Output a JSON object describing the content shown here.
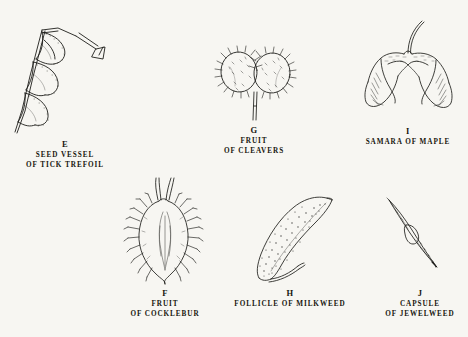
{
  "plate": {
    "title": "Plate of dispersal fruits and seed vessels",
    "background_color": "#f7f6f2",
    "ink_color": "#1a1a18"
  },
  "specimens": [
    {
      "id": "e",
      "letter": "E",
      "caption_lines": [
        "SEED VESSEL",
        "OF TICK TREFOIL"
      ],
      "common_name": "Tick Trefoil",
      "structure": "Seed vessel",
      "art_name": "tick-trefoil-loment-illustration"
    },
    {
      "id": "g",
      "letter": "G",
      "caption_lines": [
        "FRUIT",
        "OF CLEAVERS"
      ],
      "common_name": "Cleavers",
      "structure": "Fruit",
      "art_name": "cleavers-fruit-illustration"
    },
    {
      "id": "i",
      "letter": "I",
      "caption_lines": [
        "SAMARA OF MAPLE"
      ],
      "common_name": "Maple",
      "structure": "Samara",
      "art_name": "maple-samara-illustration"
    },
    {
      "id": "f",
      "letter": "F",
      "caption_lines": [
        "FRUIT",
        "OF COCKLEBUR"
      ],
      "common_name": "Cocklebur",
      "structure": "Fruit",
      "art_name": "cocklebur-fruit-illustration"
    },
    {
      "id": "h",
      "letter": "H",
      "caption_lines": [
        "FOLLICLE OF MILKWEED"
      ],
      "common_name": "Milkweed",
      "structure": "Follicle",
      "art_name": "milkweed-follicle-illustration"
    },
    {
      "id": "j",
      "letter": "J",
      "caption_lines": [
        "CAPSULE",
        "OF JEWELWEED"
      ],
      "common_name": "Jewelweed",
      "structure": "Capsule",
      "art_name": "jewelweed-capsule-illustration"
    }
  ]
}
